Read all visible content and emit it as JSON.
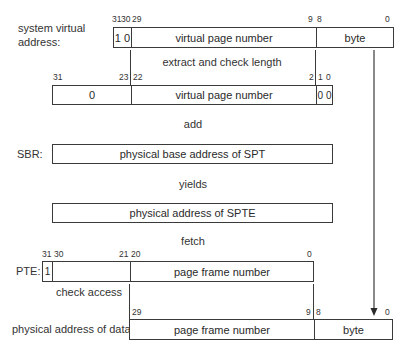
{
  "diagram": {
    "rows": {
      "sva": {
        "label_line1": "system virtual",
        "label_line2": "address:",
        "bits": [
          "31",
          "30",
          "29",
          "9",
          "8",
          "0"
        ],
        "fields": [
          "1 0",
          "virtual page number",
          "byte"
        ]
      },
      "step1": "extract and check length",
      "shifted": {
        "bits": [
          "31",
          "23",
          "22",
          "2",
          "1",
          "0"
        ],
        "fields": [
          "0",
          "virtual page number",
          "0 0"
        ]
      },
      "step2": "add",
      "sbr": {
        "label": "SBR:",
        "fields": [
          "physical base address of SPT"
        ]
      },
      "step3": "yields",
      "spte_addr": {
        "fields": [
          "physical address of SPTE"
        ]
      },
      "step4": "fetch",
      "pte": {
        "label": "PTE:",
        "bits": [
          "31",
          "30",
          "21",
          "20",
          "0"
        ],
        "fields": [
          "1",
          "",
          "page frame number"
        ]
      },
      "step5": "check access",
      "pa": {
        "label": "physical address of data:",
        "bits": [
          "29",
          "9",
          "8",
          "0"
        ],
        "fields": [
          "page frame number",
          "byte"
        ]
      }
    }
  }
}
